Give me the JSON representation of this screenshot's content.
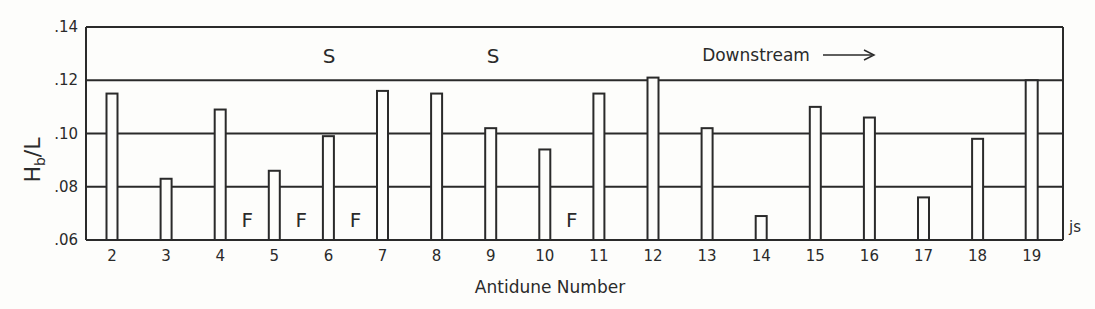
{
  "chart_data": {
    "type": "bar",
    "title": "",
    "xlabel": "Antidune Number",
    "ylabel": "Hb/L",
    "ylabel_main": "H",
    "ylabel_sub": "b",
    "ylabel_rest": "/L",
    "ylim": [
      0.06,
      0.14
    ],
    "yticks": [
      ".06",
      ".08",
      ".10",
      ".12",
      ".14"
    ],
    "grid": true,
    "categories": [
      "2",
      "3",
      "4",
      "5",
      "6",
      "7",
      "8",
      "9",
      "10",
      "11",
      "12",
      "13",
      "14",
      "15",
      "16",
      "17",
      "18",
      "19"
    ],
    "values": [
      0.115,
      0.083,
      0.109,
      0.086,
      0.099,
      0.116,
      0.115,
      0.102,
      0.094,
      0.115,
      0.121,
      0.102,
      0.069,
      0.11,
      0.106,
      0.076,
      0.098,
      0.12
    ],
    "annotations": {
      "S": [
        {
          "label": "S",
          "position_after": "6"
        },
        {
          "label": "S",
          "position_after": "9"
        }
      ],
      "F": [
        {
          "label": "F",
          "between": [
            "4",
            "5"
          ]
        },
        {
          "label": "F",
          "between": [
            "5",
            "6"
          ]
        },
        {
          "label": "F",
          "between": [
            "6",
            "7"
          ]
        },
        {
          "label": "F",
          "between": [
            "10",
            "11"
          ]
        }
      ],
      "direction": "Downstream →",
      "corner_mark": "js"
    },
    "legend": null
  },
  "labels": {
    "xlabel": "Antidune Number",
    "downstream": "Downstream",
    "s": "S",
    "f": "F",
    "js": "js"
  }
}
